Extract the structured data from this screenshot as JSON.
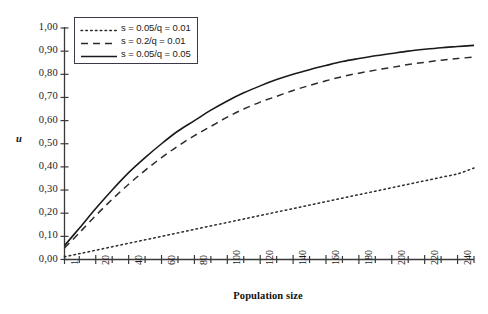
{
  "chart_data": {
    "type": "line",
    "title": "",
    "xlabel": "Population size",
    "ylabel": "u",
    "xlim": [
      1,
      250
    ],
    "ylim": [
      0.0,
      1.0
    ],
    "grid": false,
    "legend_position": "top-left",
    "y_ticks": [
      "0,00",
      "0,10",
      "0,20",
      "0,30",
      "0,40",
      "0,50",
      "0,60",
      "0,70",
      "0,80",
      "0,90",
      "1,00"
    ],
    "y_tick_values": [
      0.0,
      0.1,
      0.2,
      0.3,
      0.4,
      0.5,
      0.6,
      0.7,
      0.8,
      0.9,
      1.0
    ],
    "x_ticks": [
      "1",
      "20",
      "40",
      "60",
      "80",
      "100",
      "120",
      "140",
      "160",
      "180",
      "200",
      "220",
      "240"
    ],
    "x_tick_values": [
      1,
      20,
      40,
      60,
      80,
      100,
      120,
      140,
      160,
      180,
      200,
      220,
      240
    ],
    "x_minor_tick_values": [
      10,
      30,
      50,
      70,
      90,
      110,
      130,
      150,
      170,
      190,
      210,
      230,
      250
    ],
    "series": [
      {
        "name": "s = 0.05/q = 0.01",
        "style": "dotted",
        "color": "#2b2b2b",
        "x": [
          1,
          10,
          20,
          30,
          40,
          50,
          60,
          70,
          80,
          90,
          100,
          110,
          120,
          130,
          140,
          150,
          160,
          170,
          180,
          190,
          200,
          210,
          220,
          230,
          240,
          250
        ],
        "values": [
          0.012,
          0.025,
          0.04,
          0.055,
          0.07,
          0.085,
          0.1,
          0.115,
          0.13,
          0.145,
          0.16,
          0.175,
          0.19,
          0.205,
          0.22,
          0.235,
          0.25,
          0.265,
          0.28,
          0.295,
          0.31,
          0.325,
          0.34,
          0.355,
          0.37,
          0.395
        ]
      },
      {
        "name": "s = 0.2/q = 0.01",
        "style": "dashed",
        "color": "#2b2b2b",
        "x": [
          1,
          10,
          20,
          30,
          40,
          50,
          60,
          70,
          80,
          90,
          100,
          110,
          120,
          130,
          140,
          150,
          160,
          170,
          180,
          190,
          200,
          210,
          220,
          230,
          240,
          250
        ],
        "values": [
          0.05,
          0.115,
          0.19,
          0.26,
          0.325,
          0.385,
          0.44,
          0.49,
          0.535,
          0.575,
          0.615,
          0.65,
          0.68,
          0.705,
          0.73,
          0.752,
          0.772,
          0.79,
          0.805,
          0.818,
          0.83,
          0.842,
          0.852,
          0.861,
          0.868,
          0.875
        ]
      },
      {
        "name": "s = 0.05/q = 0.05",
        "style": "solid",
        "color": "#1a1a1a",
        "x": [
          1,
          10,
          20,
          30,
          40,
          50,
          60,
          70,
          80,
          90,
          100,
          110,
          120,
          130,
          140,
          150,
          160,
          170,
          180,
          190,
          200,
          210,
          220,
          230,
          240,
          250
        ],
        "values": [
          0.06,
          0.135,
          0.22,
          0.3,
          0.375,
          0.44,
          0.5,
          0.555,
          0.6,
          0.645,
          0.685,
          0.72,
          0.75,
          0.777,
          0.8,
          0.82,
          0.838,
          0.855,
          0.868,
          0.88,
          0.89,
          0.9,
          0.908,
          0.915,
          0.92,
          0.925
        ]
      }
    ]
  },
  "axes": {
    "y_axis_color": "#3a3a3a",
    "x_axis_color": "#3a3a3a"
  }
}
